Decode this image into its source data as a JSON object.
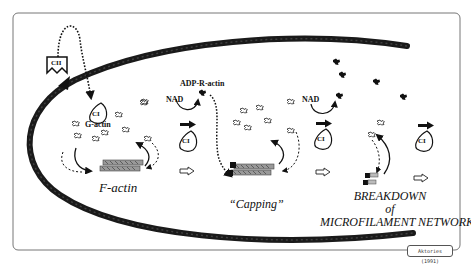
{
  "diagram": {
    "toxin_component_binding": {
      "label": "CII"
    },
    "toxin_component_enzyme": {
      "label": "CI"
    },
    "labels": {
      "g_actin": "G-actin",
      "adp_r_actin": "ADP-R-actin",
      "nad_1": "NAD",
      "nad_2": "NAD",
      "f_actin": "F-actin",
      "capping": "“Capping”",
      "breakdown_line1": "BREAKDOWN",
      "breakdown_line2": "of",
      "breakdown_line3": "MICROFILAMENT NETWORK"
    },
    "stages": [
      {
        "name": "F-actin",
        "description": "polymerization / depolymerization equilibrium"
      },
      {
        "name": "Capping",
        "description": "ADP-ribosylated actin caps filament barbed end"
      },
      {
        "name": "Breakdown of microfilament network",
        "description": "filament disassembles"
      }
    ],
    "credit": "Aktories (1991)",
    "colors": {
      "ink": "#111111",
      "membrane": "#1a1a1a",
      "frame": "#777777",
      "background": "#ffffff"
    }
  }
}
